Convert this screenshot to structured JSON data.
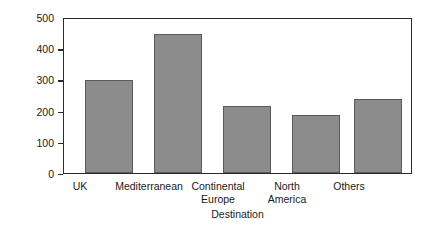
{
  "chart_data": {
    "type": "bar",
    "title": "",
    "xlabel": "Destination",
    "ylabel": "No. of respondents",
    "categories": [
      "UK",
      "Mediterranean",
      "Continental\nEurope",
      "North\nAmerica",
      "Others"
    ],
    "values": [
      298,
      446,
      215,
      186,
      237
    ],
    "ylim": [
      0,
      500
    ],
    "yticks": [
      0,
      100,
      200,
      300,
      400,
      500
    ],
    "ytick_labels": [
      "0",
      "100",
      "200",
      "300",
      "400",
      "500"
    ],
    "grid": false,
    "legend": null,
    "bar_color": "#8c8c8c",
    "bar_edge_color": "#5a5a5a",
    "axis_color": "#2b2b2b"
  }
}
